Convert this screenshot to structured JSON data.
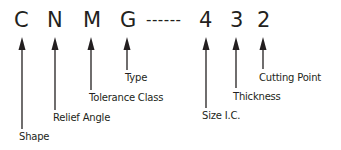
{
  "diagram": {
    "code": {
      "chars": [
        "C",
        "N",
        "M",
        "G",
        "4",
        "3",
        "2"
      ],
      "separator": "------"
    },
    "labels": {
      "shape": "Shape",
      "relief_angle": "Relief Angle",
      "tolerance_class": "Tolerance Class",
      "type": "Type",
      "size_ic": "Size I.C.",
      "thickness": "Thickness",
      "cutting_point": "Cutting Point"
    },
    "colors": {
      "ink": "#231f20",
      "background": "#ffffff"
    }
  }
}
